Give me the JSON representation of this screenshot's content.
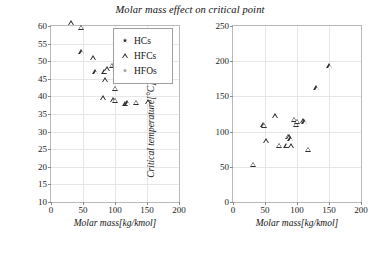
{
  "figure": {
    "title": "Molar mass effect on critical point"
  },
  "legend": {
    "items": [
      {
        "label": "HCs",
        "marker": "star-dark",
        "color": "#2a2a2a"
      },
      {
        "label": "HFCs",
        "marker": "triangle-open",
        "color": "#2f2f2f"
      },
      {
        "label": "HFOs",
        "marker": "star-gray",
        "color": "#9a9a9a"
      }
    ]
  },
  "chart_data": [
    {
      "id": "critical-pressure",
      "type": "scatter",
      "title": "Molar mass effect on critical point",
      "xlabel": "Molar mass[kg/kmol]",
      "ylabel": "Critical pressure[bar]",
      "xlim": [
        0,
        200
      ],
      "ylim": [
        10,
        60
      ],
      "xticks": [
        0,
        50,
        100,
        150,
        200
      ],
      "yticks": [
        10,
        15,
        20,
        25,
        30,
        35,
        40,
        45,
        50,
        55,
        60
      ],
      "grid": true,
      "legend_position": "top-right",
      "series": [
        {
          "name": "HCs",
          "marker": "star-dark",
          "color": "#2a2a2a",
          "points": [
            [
              30,
              48.8
            ],
            [
              44,
              42.5
            ],
            [
              58,
              38.0
            ],
            [
              58,
              36.4
            ],
            [
              72,
              33.9
            ],
            [
              86,
              46.0
            ],
            [
              86,
              45.0
            ],
            [
              88,
              43.0
            ],
            [
              100,
              40.5
            ],
            [
              101,
              37.2
            ],
            [
              114,
              36.2
            ]
          ]
        },
        {
          "name": "HFCs",
          "marker": "triangle-open",
          "color": "#2f2f2f",
          "points": [
            [
              32,
              59.1
            ],
            [
              47,
              57.8
            ],
            [
              48,
              50.9
            ],
            [
              66,
              49.1
            ],
            [
              70,
              45.1
            ],
            [
              84,
              45.3
            ],
            [
              88,
              46.0
            ],
            [
              96,
              47.0
            ],
            [
              99,
              47.0
            ],
            [
              85,
              42.9
            ],
            [
              100,
              40.5
            ],
            [
              116,
              42.8
            ],
            [
              82,
              37.7
            ],
            [
              97,
              37.2
            ],
            [
              100,
              37.1
            ],
            [
              117,
              36.2
            ],
            [
              120,
              36.3
            ],
            [
              133,
              36.5
            ],
            [
              152,
              36.6
            ]
          ]
        },
        {
          "name": "HFOs",
          "marker": "star-gray",
          "color": "#9a9a9a",
          "points": [
            [
              43,
              58.6
            ],
            [
              58,
              36.4
            ],
            [
              97,
              37.0
            ],
            [
              114,
              33.9
            ],
            [
              116,
              36.2
            ],
            [
              163,
              28.9
            ]
          ]
        }
      ]
    },
    {
      "id": "critical-temperature",
      "type": "scatter",
      "title": "Molar mass effect on critical point",
      "xlabel": "Molar mass[kg/kmol]",
      "ylabel": "Critical temperature[°C]",
      "xlim": [
        0,
        200
      ],
      "ylim": [
        0,
        250
      ],
      "xticks": [
        0,
        50,
        100,
        150,
        200
      ],
      "yticks": [
        0,
        50,
        100,
        150,
        200,
        250
      ],
      "grid": true,
      "legend_position": "none",
      "series": [
        {
          "name": "HCs",
          "marker": "star-dark",
          "color": "#2a2a2a",
          "points": [
            [
              31,
              32.0
            ],
            [
              58,
              134.8
            ],
            [
              58,
              152.0
            ],
            [
              72,
              187.5
            ],
            [
              86,
              84.0
            ],
            [
              88,
              85.5
            ],
            [
              90,
              82.0
            ],
            [
              100,
              101.5
            ],
            [
              103,
              71.0
            ],
            [
              106,
              71.5
            ]
          ]
        },
        {
          "name": "HFCs",
          "marker": "triangle-open",
          "color": "#2f2f2f",
          "points": [
            [
              32,
              44.5
            ],
            [
              48,
              101.5
            ],
            [
              49,
              100.0
            ],
            [
              52,
              78.0
            ],
            [
              66,
              113.0
            ],
            [
              72,
              71.5
            ],
            [
              84,
              71.5
            ],
            [
              86,
              84.5
            ],
            [
              88,
              83.5
            ],
            [
              90,
              81.0
            ],
            [
              91,
              71.0
            ],
            [
              96,
              108.5
            ],
            [
              99,
              101.0
            ],
            [
              100,
              105.5
            ],
            [
              110,
              106.0
            ],
            [
              112,
              105.0
            ],
            [
              118,
              66.0
            ],
            [
              131,
              153.5
            ],
            [
              151,
              184.0
            ]
          ]
        },
        {
          "name": "HFOs",
          "marker": "star-gray",
          "color": "#9a9a9a",
          "points": [
            [
              47,
              98.0
            ],
            [
              108,
              105.5
            ],
            [
              112,
              94.5
            ],
            [
              131,
              166.5
            ],
            [
              163,
              170.5
            ]
          ]
        }
      ]
    }
  ]
}
